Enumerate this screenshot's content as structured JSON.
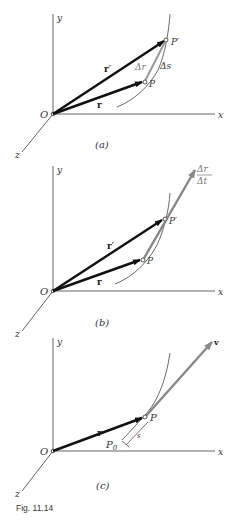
{
  "figure": {
    "caption": "Fig. 11.14",
    "panels": [
      {
        "id": "a",
        "label": "(a)",
        "axes": {
          "x": "x",
          "y": "y",
          "z": "z",
          "origin": "O"
        },
        "vectors": {
          "r": "r",
          "r_prime": "r′",
          "delta_r": "Δr"
        },
        "points": {
          "P": "P",
          "P_prime": "P′"
        },
        "arc_label": "Δs"
      },
      {
        "id": "b",
        "label": "(b)",
        "axes": {
          "x": "x",
          "y": "y",
          "z": "z",
          "origin": "O"
        },
        "vectors": {
          "r": "r",
          "r_prime": "r′"
        },
        "points": {
          "P": "P",
          "P_prime": "P′"
        },
        "fraction": {
          "numerator": "Δr",
          "denominator": "Δt"
        }
      },
      {
        "id": "c",
        "label": "(c)",
        "axes": {
          "x": "x",
          "y": "y",
          "z": "z",
          "origin": "O"
        },
        "vectors": {
          "r": "r",
          "v": "v"
        },
        "points": {
          "P": "P",
          "P0": "P",
          "P0_sub": "0"
        },
        "arc_label": "s"
      }
    ]
  },
  "colors": {
    "black": "#111111",
    "gray": "#888888",
    "axis": "#555555"
  }
}
